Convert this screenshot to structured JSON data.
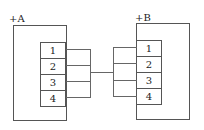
{
  "devices": [
    {
      "label": "+A",
      "terminals": [
        "1",
        "2",
        "3",
        "4"
      ]
    },
    {
      "label": "+B",
      "terminals": [
        "1",
        "2",
        "3",
        "4"
      ]
    }
  ],
  "colors": {
    "line": "#555555",
    "background": "#ffffff"
  }
}
